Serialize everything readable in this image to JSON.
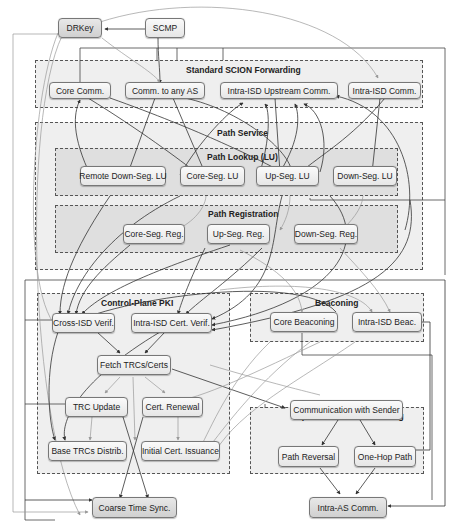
{
  "colors": {
    "edge_dark": "#333333",
    "edge_light": "#9a9a9a",
    "group_bg": "#e1e1e1",
    "node_bg": "#f0f0f0"
  },
  "groups": {
    "standard_forwarding": "Standard SCION Forwarding",
    "path_service": "Path Service",
    "path_lookup": "Path Lookup (LU)",
    "path_registration": "Path Registration",
    "control_plane_pki": "Control-Plane PKI",
    "beaconing": "Beaconing",
    "special_forwarding": "Special SCION Forwarding"
  },
  "nodes": {
    "drkey": "DRKey",
    "scmp": "SCMP",
    "core_comm": "Core Comm.",
    "comm_any_as": "Comm. to any AS",
    "intra_isd_upstream": "Intra-ISD Upstream Comm.",
    "intra_isd_comm": "Intra-ISD Comm.",
    "remote_down_seg_lu": "Remote Down-Seg. LU",
    "core_seg_lu": "Core-Seg. LU",
    "up_seg_lu": "Up-Seg. LU",
    "down_seg_lu": "Down-Seg. LU",
    "core_seg_reg": "Core-Seg. Reg.",
    "up_seg_reg": "Up-Seg. Reg.",
    "down_seg_reg": "Down-Seg. Reg.",
    "cross_isd_verif": "Cross-ISD Verif.",
    "intra_isd_cert_verif": "Intra-ISD Cert. Verif.",
    "fetch_trcs": "Fetch TRCs/Certs",
    "trc_update": "TRC Update",
    "cert_renewal": "Cert. Renewal",
    "base_trcs": "Base TRCs Distrib.",
    "initial_cert": "Initial Cert. Issuance",
    "core_beaconing": "Core Beaconing",
    "intra_isd_beac": "Intra-ISD Beac.",
    "comm_with_sender": "Communication with Sender",
    "path_reversal": "Path Reversal",
    "one_hop_path": "One-Hop Path",
    "coarse_time_sync": "Coarse Time Sync.",
    "intra_as_comm": "Intra-AS Comm."
  }
}
